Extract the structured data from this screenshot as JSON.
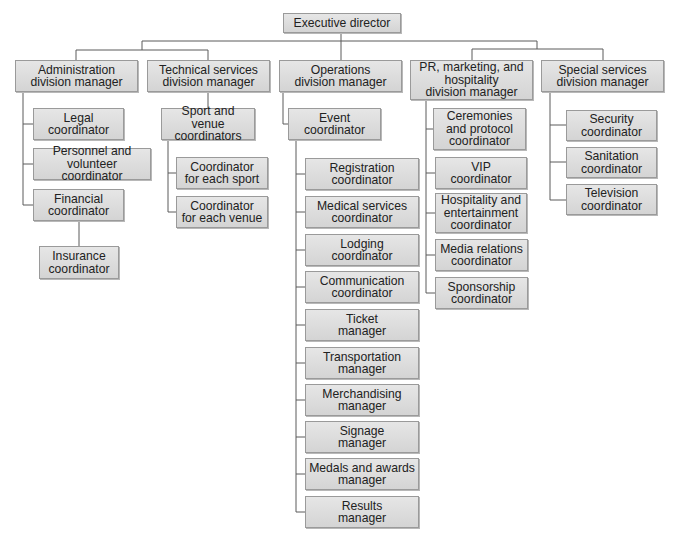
{
  "nodes": [
    {
      "id": "exec",
      "label": "Executive director",
      "x": 283,
      "y": 13,
      "w": 118,
      "h": 20
    },
    {
      "id": "admin",
      "label": "Administration\ndivision manager",
      "x": 15,
      "y": 60,
      "w": 123,
      "h": 32
    },
    {
      "id": "tech",
      "label": "Technical services\ndivision manager",
      "x": 147,
      "y": 60,
      "w": 123,
      "h": 32
    },
    {
      "id": "ops",
      "label": "Operations\ndivision manager",
      "x": 279,
      "y": 60,
      "w": 123,
      "h": 32
    },
    {
      "id": "pr",
      "label": "PR, marketing, and\nhospitality\ndivision manager",
      "x": 410,
      "y": 60,
      "w": 123,
      "h": 40
    },
    {
      "id": "special",
      "label": "Special services\ndivision manager",
      "x": 541,
      "y": 60,
      "w": 123,
      "h": 32
    },
    {
      "id": "legal",
      "label": "Legal\ncoordinator",
      "x": 33,
      "y": 108,
      "w": 91,
      "h": 32
    },
    {
      "id": "personnel",
      "label": "Personnel and\nvolunteer coordinator",
      "x": 33,
      "y": 148,
      "w": 118,
      "h": 32
    },
    {
      "id": "financial",
      "label": "Financial\ncoordinator",
      "x": 33,
      "y": 189,
      "w": 91,
      "h": 32
    },
    {
      "id": "insurance",
      "label": "Insurance\ncoordinator",
      "x": 39,
      "y": 246,
      "w": 80,
      "h": 33
    },
    {
      "id": "sport-venue",
      "label": "Sport and venue\ncoordinators",
      "x": 161,
      "y": 108,
      "w": 94,
      "h": 32
    },
    {
      "id": "each-sport",
      "label": "Coordinator\nfor each sport",
      "x": 176,
      "y": 157,
      "w": 92,
      "h": 32
    },
    {
      "id": "each-venue",
      "label": "Coordinator\nfor each venue",
      "x": 176,
      "y": 196,
      "w": 92,
      "h": 32
    },
    {
      "id": "event",
      "label": "Event\ncoordinator",
      "x": 288,
      "y": 108,
      "w": 93,
      "h": 32
    },
    {
      "id": "registration",
      "label": "Registration\ncoordinator",
      "x": 305,
      "y": 158,
      "w": 114,
      "h": 32
    },
    {
      "id": "medical",
      "label": "Medical services\ncoordinator",
      "x": 305,
      "y": 196,
      "w": 114,
      "h": 32
    },
    {
      "id": "lodging",
      "label": "Lodging\ncoordinator",
      "x": 305,
      "y": 234,
      "w": 114,
      "h": 32
    },
    {
      "id": "communication",
      "label": "Communication\ncoordinator",
      "x": 305,
      "y": 271,
      "w": 114,
      "h": 32
    },
    {
      "id": "ticket",
      "label": "Ticket\nmanager",
      "x": 305,
      "y": 309,
      "w": 114,
      "h": 32
    },
    {
      "id": "transportation",
      "label": "Transportation\nmanager",
      "x": 305,
      "y": 347,
      "w": 114,
      "h": 32
    },
    {
      "id": "merchandising",
      "label": "Merchandising\nmanager",
      "x": 305,
      "y": 384,
      "w": 114,
      "h": 32
    },
    {
      "id": "signage",
      "label": "Signage\nmanager",
      "x": 305,
      "y": 421,
      "w": 114,
      "h": 32
    },
    {
      "id": "medals",
      "label": "Medals and awards\nmanager",
      "x": 305,
      "y": 458,
      "w": 114,
      "h": 32
    },
    {
      "id": "results",
      "label": "Results\nmanager",
      "x": 305,
      "y": 496,
      "w": 114,
      "h": 32
    },
    {
      "id": "ceremonies",
      "label": "Ceremonies\nand protocol\ncoordinator",
      "x": 433,
      "y": 108,
      "w": 93,
      "h": 42
    },
    {
      "id": "vip",
      "label": "VIP\ncoordinator",
      "x": 435,
      "y": 157,
      "w": 92,
      "h": 32
    },
    {
      "id": "hospitality",
      "label": "Hospitality and\nentertainment\ncoordinator",
      "x": 435,
      "y": 193,
      "w": 92,
      "h": 40
    },
    {
      "id": "media",
      "label": "Media relations\ncoordinator",
      "x": 435,
      "y": 239,
      "w": 93,
      "h": 32
    },
    {
      "id": "sponsorship",
      "label": "Sponsorship\ncoordinator",
      "x": 435,
      "y": 277,
      "w": 93,
      "h": 32
    },
    {
      "id": "security",
      "label": "Security\ncoordinator",
      "x": 566,
      "y": 110,
      "w": 91,
      "h": 31
    },
    {
      "id": "sanitation",
      "label": "Sanitation\ncoordinator",
      "x": 566,
      "y": 147,
      "w": 91,
      "h": 31
    },
    {
      "id": "television",
      "label": "Television\ncoordinator",
      "x": 566,
      "y": 184,
      "w": 91,
      "h": 31
    }
  ],
  "edges": [
    [
      "exec",
      "admin"
    ],
    [
      "exec",
      "tech"
    ],
    [
      "exec",
      "ops"
    ],
    [
      "exec",
      "pr"
    ],
    [
      "exec",
      "special"
    ],
    [
      "admin",
      "legal"
    ],
    [
      "admin",
      "personnel"
    ],
    [
      "admin",
      "financial"
    ],
    [
      "financial",
      "insurance"
    ],
    [
      "tech",
      "sport-venue"
    ],
    [
      "sport-venue",
      "each-sport"
    ],
    [
      "sport-venue",
      "each-venue"
    ],
    [
      "ops",
      "event"
    ],
    [
      "event",
      "registration"
    ],
    [
      "event",
      "medical"
    ],
    [
      "event",
      "lodging"
    ],
    [
      "event",
      "communication"
    ],
    [
      "event",
      "ticket"
    ],
    [
      "event",
      "transportation"
    ],
    [
      "event",
      "merchandising"
    ],
    [
      "event",
      "signage"
    ],
    [
      "event",
      "medals"
    ],
    [
      "event",
      "results"
    ],
    [
      "pr",
      "ceremonies"
    ],
    [
      "pr",
      "vip"
    ],
    [
      "pr",
      "hospitality"
    ],
    [
      "pr",
      "media"
    ],
    [
      "pr",
      "sponsorship"
    ],
    [
      "special",
      "security"
    ],
    [
      "special",
      "sanitation"
    ],
    [
      "special",
      "television"
    ]
  ],
  "colors": {
    "box_fill_top": "#e6e6e6",
    "box_fill_bottom": "#d4d4d4",
    "box_border": "#9a9a9a",
    "line": "#5a5a5a",
    "text": "#222222"
  }
}
